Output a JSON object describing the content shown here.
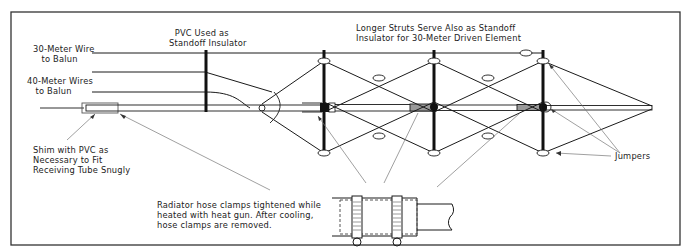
{
  "figure": {
    "type": "antenna-construction-diagram",
    "colors": {
      "line": "#1a1a1a",
      "leader": "#777777",
      "background": "#ffffff",
      "tube_fill": "#999999"
    }
  },
  "labels": {
    "wire_30m": "30-Meter Wire\n   to Balun",
    "wire_40m": "40-Meter Wires\n   to Balun",
    "pvc_standoff": "  PVC Used as\nStandoff Insulator",
    "longer_struts": "Longer Struts Serve Also as Standoff\nInsulator for 30-Meter Driven Element",
    "shim": "Shim with PVC as\nNecessary to Fit\nReceiving Tube Snugly",
    "radiator_clamps": "Radiator hose clamps tightened while\nheated with heat gun. After cooling,\nhose clamps are removed.",
    "jumpers": "Jumpers"
  }
}
